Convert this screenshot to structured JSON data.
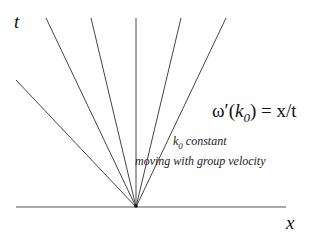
{
  "diagram": {
    "axes": {
      "t_label": "t",
      "x_label": "x"
    },
    "equation": {
      "prefix": "ω′(",
      "k": "k",
      "k_sub": "0",
      "suffix": ") = x/t"
    },
    "annotation": {
      "line1_k": "k",
      "line1_sub": "0",
      "line1_text": " constant",
      "line2": "moving with group velocity"
    },
    "origin": [
      136,
      207
    ],
    "ray_endpoints": [
      [
        16,
        80
      ],
      [
        46,
        18
      ],
      [
        91,
        18
      ],
      [
        136,
        18
      ],
      [
        181,
        18
      ],
      [
        226,
        18
      ]
    ]
  }
}
